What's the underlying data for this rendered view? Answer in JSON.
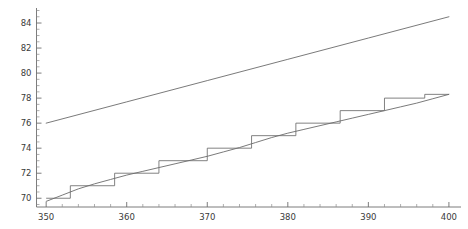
{
  "chart_data": {
    "type": "line",
    "title": "",
    "xlabel": "",
    "ylabel": "",
    "xlim": [
      348.8,
      401.5
    ],
    "ylim": [
      69.3,
      85.2
    ],
    "grid": false,
    "legend": null,
    "x_ticks": [
      350,
      360,
      370,
      380,
      390,
      400
    ],
    "x_tick_labels": [
      "350",
      "360",
      "370",
      "380",
      "390",
      "400"
    ],
    "x_minor_step": 2,
    "y_ticks": [
      70,
      72,
      74,
      76,
      78,
      80,
      82,
      84
    ],
    "y_tick_labels": [
      "70",
      "72",
      "74",
      "76",
      "78",
      "80",
      "82",
      "84"
    ],
    "y_minor_step": 0.5,
    "line_color": "#6b6b6b",
    "axis_color": "#6e6e6e",
    "background_color": "#ffffff",
    "series": [
      {
        "name": "upper-line",
        "type": "line",
        "x": [
          350,
          360,
          370,
          380,
          390,
          400
        ],
        "values": [
          76.0,
          77.7,
          79.4,
          81.1,
          82.8,
          84.5
        ]
      },
      {
        "name": "lower-curve",
        "type": "line",
        "x": [
          350,
          352,
          354,
          356,
          358,
          360,
          362,
          364,
          366,
          368,
          370,
          372,
          374,
          376,
          378,
          380,
          382,
          384,
          386,
          388,
          390,
          392,
          394,
          396,
          398,
          400
        ],
        "values": [
          69.75,
          70.25,
          70.75,
          71.15,
          71.5,
          71.85,
          72.15,
          72.45,
          72.75,
          73.05,
          73.35,
          73.7,
          74.05,
          74.45,
          74.85,
          75.2,
          75.5,
          75.8,
          76.1,
          76.4,
          76.7,
          77.0,
          77.3,
          77.6,
          77.95,
          78.3
        ]
      },
      {
        "name": "lower-step",
        "type": "step",
        "x": [
          350,
          353,
          358.5,
          364,
          370,
          375.5,
          381,
          386.5,
          392,
          397,
          400
        ],
        "values": [
          70.0,
          71.0,
          72.0,
          73.0,
          74.0,
          75.0,
          76.0,
          77.0,
          78.0,
          78.3,
          78.3
        ]
      }
    ]
  }
}
